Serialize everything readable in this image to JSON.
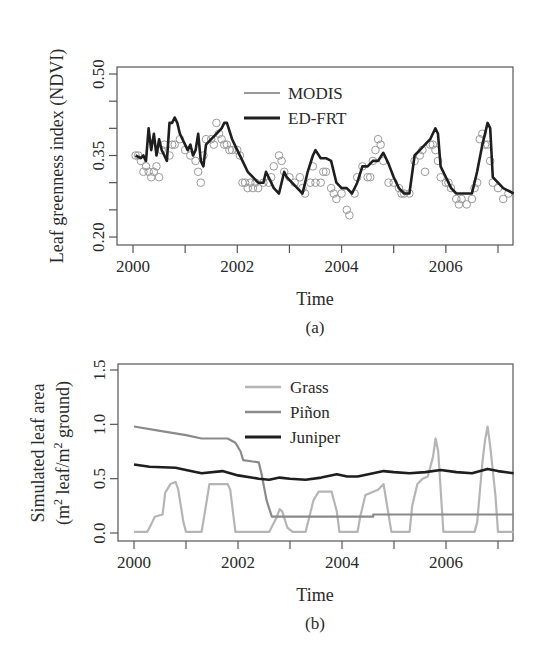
{
  "figure": {
    "panel_a": {
      "caption": "(a)",
      "ylabel": "Leaf greenness index (NDVI)",
      "xlabel": "Time",
      "y_tick_labels": [
        "0.20",
        "0.35",
        "0.50"
      ],
      "x_tick_labels": [
        "2000",
        "2002",
        "2004",
        "2006"
      ],
      "legend": [
        {
          "label": "MODIS",
          "color": "#9a9a9a"
        },
        {
          "label": "ED-FRT",
          "color": "#1e1e1e"
        }
      ]
    },
    "panel_b": {
      "caption": "(b)",
      "ylabel_line1": "Simulated leaf area",
      "ylabel_line2_parts": [
        "(m",
        "2",
        " leaf/m",
        "2",
        " ground)"
      ],
      "xlabel": "Time",
      "y_tick_labels": [
        "0.0",
        "0.5",
        "1.0",
        "1.5"
      ],
      "x_tick_labels": [
        "2000",
        "2002",
        "2004",
        "2006"
      ],
      "legend": [
        {
          "label": "Grass",
          "color": "#b5b5b5"
        },
        {
          "label": "Piñon",
          "color": "#8a8a8a"
        },
        {
          "label": "Juniper",
          "color": "#1e1e1e"
        }
      ]
    }
  },
  "chart_data": [
    {
      "type": "line",
      "panel": "(a)",
      "title": "",
      "xlabel": "Time",
      "ylabel": "Leaf greenness index (NDVI)",
      "xlim": [
        1999.9,
        2007.3
      ],
      "ylim": [
        0.19,
        0.52
      ],
      "x_ticks": [
        2000,
        2001,
        2002,
        2003,
        2004,
        2005,
        2006,
        2007
      ],
      "x_tick_labels": [
        "2000",
        "2002",
        "2004",
        "2006"
      ],
      "y_ticks": [
        0.2,
        0.25,
        0.3,
        0.35,
        0.4,
        0.45,
        0.5
      ],
      "y_tick_labels": [
        "0.20",
        "0.35",
        "0.50"
      ],
      "grid": false,
      "legend_position": "top-center",
      "series": [
        {
          "name": "MODIS",
          "style": "scatter-open-circles",
          "color": "#9a9a9a",
          "x": [
            2000.05,
            2000.1,
            2000.15,
            2000.2,
            2000.25,
            2000.3,
            2000.35,
            2000.4,
            2000.45,
            2000.5,
            2000.55,
            2000.6,
            2000.7,
            2000.75,
            2000.8,
            2000.9,
            2001.0,
            2001.1,
            2001.2,
            2001.25,
            2001.3,
            2001.35,
            2001.4,
            2001.5,
            2001.55,
            2001.6,
            2001.65,
            2001.7,
            2001.75,
            2001.8,
            2001.85,
            2001.9,
            2002.0,
            2002.05,
            2002.1,
            2002.15,
            2002.2,
            2002.25,
            2002.3,
            2002.35,
            2002.4,
            2002.5,
            2002.6,
            2002.65,
            2002.7,
            2002.8,
            2002.85,
            2002.9,
            2003.0,
            2003.1,
            2003.2,
            2003.25,
            2003.3,
            2003.4,
            2003.45,
            2003.5,
            2003.6,
            2003.65,
            2003.7,
            2003.8,
            2003.85,
            2003.9,
            2004.0,
            2004.1,
            2004.15,
            2004.25,
            2004.3,
            2004.4,
            2004.5,
            2004.55,
            2004.6,
            2004.65,
            2004.7,
            2004.75,
            2004.8,
            2004.9,
            2005.0,
            2005.1,
            2005.15,
            2005.2,
            2005.3,
            2005.4,
            2005.5,
            2005.55,
            2005.6,
            2005.7,
            2005.75,
            2005.8,
            2005.85,
            2005.9,
            2006.0,
            2006.05,
            2006.1,
            2006.2,
            2006.25,
            2006.3,
            2006.4,
            2006.5,
            2006.55,
            2006.6,
            2006.65,
            2006.7,
            2006.75,
            2006.8,
            2006.85,
            2006.9,
            2007.0,
            2007.1,
            2007.2
          ],
          "y": [
            0.35,
            0.35,
            0.34,
            0.32,
            0.33,
            0.32,
            0.31,
            0.32,
            0.33,
            0.31,
            0.36,
            0.37,
            0.35,
            0.37,
            0.37,
            0.38,
            0.36,
            0.35,
            0.34,
            0.32,
            0.3,
            0.35,
            0.38,
            0.38,
            0.37,
            0.41,
            0.39,
            0.38,
            0.37,
            0.37,
            0.36,
            0.36,
            0.36,
            0.35,
            0.3,
            0.3,
            0.29,
            0.3,
            0.29,
            0.3,
            0.29,
            0.3,
            0.3,
            0.31,
            0.33,
            0.35,
            0.34,
            0.32,
            0.31,
            0.3,
            0.31,
            0.29,
            0.28,
            0.3,
            0.33,
            0.3,
            0.3,
            0.32,
            0.32,
            0.29,
            0.28,
            0.27,
            0.28,
            0.25,
            0.24,
            0.28,
            0.31,
            0.33,
            0.31,
            0.31,
            0.34,
            0.36,
            0.38,
            0.37,
            0.34,
            0.3,
            0.3,
            0.29,
            0.28,
            0.28,
            0.28,
            0.34,
            0.35,
            0.36,
            0.32,
            0.37,
            0.37,
            0.36,
            0.34,
            0.31,
            0.3,
            0.3,
            0.29,
            0.27,
            0.26,
            0.27,
            0.26,
            0.27,
            0.29,
            0.3,
            0.38,
            0.39,
            0.37,
            0.37,
            0.34,
            0.3,
            0.29,
            0.27,
            0.28
          ]
        },
        {
          "name": "ED-FRT",
          "style": "line",
          "color": "#1e1e1e",
          "x": [
            2000.05,
            2000.15,
            2000.2,
            2000.25,
            2000.3,
            2000.35,
            2000.4,
            2000.45,
            2000.5,
            2000.55,
            2000.6,
            2000.65,
            2000.7,
            2000.75,
            2000.8,
            2000.85,
            2000.9,
            2000.95,
            2001.0,
            2001.05,
            2001.1,
            2001.15,
            2001.2,
            2001.25,
            2001.3,
            2001.35,
            2001.4,
            2001.5,
            2001.6,
            2001.7,
            2001.75,
            2001.8,
            2001.9,
            2002.0,
            2002.1,
            2002.2,
            2002.3,
            2002.4,
            2002.5,
            2002.55,
            2002.6,
            2002.7,
            2002.8,
            2002.9,
            2002.95,
            2003.05,
            2003.15,
            2003.25,
            2003.35,
            2003.45,
            2003.5,
            2003.6,
            2003.7,
            2003.8,
            2003.9,
            2004.0,
            2004.1,
            2004.2,
            2004.3,
            2004.4,
            2004.5,
            2004.6,
            2004.7,
            2004.8,
            2004.9,
            2005.0,
            2005.1,
            2005.2,
            2005.3,
            2005.4,
            2005.5,
            2005.6,
            2005.7,
            2005.8,
            2005.85,
            2005.9,
            2006.0,
            2006.1,
            2006.2,
            2006.3,
            2006.4,
            2006.5,
            2006.6,
            2006.7,
            2006.8,
            2006.85,
            2006.9,
            2007.0,
            2007.1,
            2007.2,
            2007.3
          ],
          "y": [
            0.35,
            0.345,
            0.35,
            0.34,
            0.4,
            0.36,
            0.39,
            0.35,
            0.38,
            0.36,
            0.35,
            0.34,
            0.41,
            0.41,
            0.42,
            0.41,
            0.39,
            0.38,
            0.37,
            0.36,
            0.37,
            0.35,
            0.36,
            0.39,
            0.34,
            0.33,
            0.37,
            0.38,
            0.39,
            0.4,
            0.41,
            0.41,
            0.38,
            0.36,
            0.34,
            0.32,
            0.31,
            0.3,
            0.3,
            0.32,
            0.31,
            0.29,
            0.28,
            0.32,
            0.31,
            0.3,
            0.29,
            0.28,
            0.32,
            0.35,
            0.36,
            0.345,
            0.345,
            0.34,
            0.3,
            0.29,
            0.29,
            0.28,
            0.3,
            0.33,
            0.33,
            0.34,
            0.34,
            0.355,
            0.335,
            0.31,
            0.29,
            0.28,
            0.28,
            0.35,
            0.36,
            0.37,
            0.38,
            0.4,
            0.39,
            0.33,
            0.31,
            0.29,
            0.28,
            0.28,
            0.28,
            0.28,
            0.32,
            0.37,
            0.41,
            0.4,
            0.31,
            0.3,
            0.29,
            0.285,
            0.28
          ]
        }
      ]
    },
    {
      "type": "line",
      "panel": "(b)",
      "title": "",
      "xlabel": "Time",
      "ylabel": "Simulated leaf area (m2 leaf/m2 ground)",
      "xlim": [
        1999.9,
        2007.3
      ],
      "ylim": [
        -0.05,
        1.55
      ],
      "x_ticks": [
        2000,
        2001,
        2002,
        2003,
        2004,
        2005,
        2006,
        2007
      ],
      "x_tick_labels": [
        "2000",
        "2002",
        "2004",
        "2006"
      ],
      "y_ticks": [
        0.0,
        0.5,
        1.0,
        1.5
      ],
      "y_tick_labels": [
        "0.0",
        "0.5",
        "1.0",
        "1.5"
      ],
      "grid": false,
      "legend_position": "top-center",
      "series": [
        {
          "name": "Grass",
          "color": "#b5b5b5",
          "x": [
            2000.0,
            2000.25,
            2000.3,
            2000.4,
            2000.55,
            2000.6,
            2000.7,
            2000.8,
            2000.85,
            2000.95,
            2001.0,
            2001.3,
            2001.4,
            2001.45,
            2001.8,
            2001.85,
            2001.95,
            2002.6,
            2002.75,
            2002.8,
            2002.85,
            2002.95,
            2003.05,
            2003.3,
            2003.45,
            2003.55,
            2003.6,
            2003.8,
            2003.9,
            2003.95,
            2004.3,
            2004.35,
            2004.45,
            2004.5,
            2004.7,
            2004.8,
            2004.85,
            2004.95,
            2005.3,
            2005.35,
            2005.45,
            2005.55,
            2005.65,
            2005.75,
            2005.8,
            2005.85,
            2005.95,
            2006.55,
            2006.6,
            2006.7,
            2006.75,
            2006.8,
            2006.85,
            2006.95,
            2007.0,
            2007.3
          ],
          "y": [
            0.01,
            0.01,
            0.05,
            0.15,
            0.17,
            0.37,
            0.45,
            0.47,
            0.4,
            0.1,
            0.01,
            0.01,
            0.3,
            0.45,
            0.45,
            0.4,
            0.01,
            0.01,
            0.15,
            0.22,
            0.2,
            0.05,
            0.01,
            0.01,
            0.3,
            0.38,
            0.38,
            0.38,
            0.2,
            0.01,
            0.01,
            0.15,
            0.35,
            0.36,
            0.4,
            0.45,
            0.3,
            0.01,
            0.01,
            0.25,
            0.45,
            0.5,
            0.52,
            0.7,
            0.87,
            0.75,
            0.01,
            0.01,
            0.1,
            0.65,
            0.85,
            0.98,
            0.8,
            0.35,
            0.01,
            0.01
          ]
        },
        {
          "name": "Piñon",
          "color": "#8a8a8a",
          "x": [
            2000.0,
            2000.5,
            2001.0,
            2001.3,
            2001.8,
            2001.95,
            2002.05,
            2002.1,
            2002.4,
            2002.45,
            2002.55,
            2002.65,
            2002.8,
            2004.6,
            2004.6,
            2007.3
          ],
          "y": [
            0.98,
            0.94,
            0.9,
            0.87,
            0.87,
            0.83,
            0.75,
            0.67,
            0.65,
            0.55,
            0.3,
            0.15,
            0.15,
            0.15,
            0.17,
            0.17
          ]
        },
        {
          "name": "Juniper",
          "color": "#1e1e1e",
          "x": [
            2000.0,
            2000.3,
            2000.8,
            2001.0,
            2001.3,
            2001.7,
            2002.0,
            2002.4,
            2002.6,
            2002.8,
            2003.0,
            2003.3,
            2003.6,
            2003.9,
            2004.1,
            2004.3,
            2004.6,
            2004.8,
            2005.0,
            2005.3,
            2005.6,
            2005.9,
            2006.2,
            2006.5,
            2006.8,
            2007.0,
            2007.3
          ],
          "y": [
            0.63,
            0.61,
            0.6,
            0.58,
            0.55,
            0.57,
            0.53,
            0.5,
            0.49,
            0.51,
            0.5,
            0.49,
            0.51,
            0.54,
            0.52,
            0.52,
            0.55,
            0.57,
            0.56,
            0.55,
            0.56,
            0.58,
            0.56,
            0.55,
            0.59,
            0.57,
            0.55
          ]
        }
      ]
    }
  ]
}
